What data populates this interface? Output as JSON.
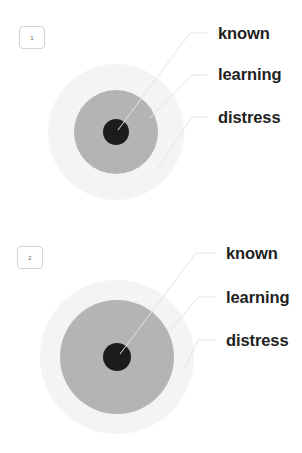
{
  "diagrams": [
    {
      "badge": "1",
      "layers": [
        {
          "name": "known",
          "label": "known",
          "color": "#f3f3f3",
          "radius": 68
        },
        {
          "name": "learning",
          "label": "learning",
          "color": "#b3b3b3",
          "radius": 42
        },
        {
          "name": "distress",
          "label": "distress",
          "color": "#1c1c1c",
          "radius": 13
        }
      ]
    },
    {
      "badge": "2",
      "layers": [
        {
          "name": "known",
          "label": "known",
          "color": "#f3f3f3",
          "radius": 77
        },
        {
          "name": "learning",
          "label": "learning",
          "color": "#b3b3b3",
          "radius": 57
        },
        {
          "name": "distress",
          "label": "distress",
          "color": "#1c1c1c",
          "radius": 14
        }
      ]
    }
  ]
}
